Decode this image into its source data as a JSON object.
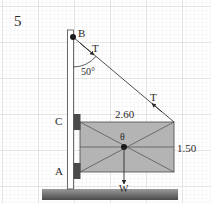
{
  "problem_number": "5",
  "labels": {
    "point_b": "B",
    "point_c": "C",
    "point_a": "A",
    "tension_top": "T",
    "tension_mid": "T",
    "angle": "50°",
    "width_dim": "2.60",
    "height_dim": "1.50",
    "center": "θ",
    "weight": "W"
  },
  "colors": {
    "grid_minor": "#e4e4e4",
    "grid_major": "#c8c8c8",
    "sign_fill": "#b4b4b4",
    "bracket": "#4a4a4a",
    "line": "#3a3a3a",
    "ground_top": "#8a8a8a",
    "ground_bottom": "#4e4e4e"
  }
}
